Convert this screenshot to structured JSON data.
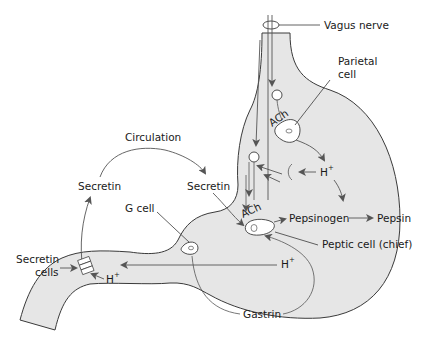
{
  "colors": {
    "stomach_fill": "#e6e6e6",
    "outline": "#3a3a3a",
    "arrow": "#555555",
    "text": "#1a1a1a"
  },
  "labels": {
    "vagus_nerve": "Vagus nerve",
    "parietal_cell_1": "Parietal",
    "parietal_cell_2": "cell",
    "circulation": "Circulation",
    "secretin_left": "Secretin",
    "secretin_right": "Secretin",
    "g_cell": "G cell",
    "ach_top": "ACh",
    "ach_bottom": "ACh",
    "h_plus_mid": "H",
    "h_plus_bottom": "H",
    "h_plus_duodenum": "H",
    "plus": "+",
    "pepsinogen": "Pepsinogen",
    "pepsin": "Pepsin",
    "peptic_cell": "Peptic cell (chief)",
    "secretin_cells_1": "Secretin",
    "secretin_cells_2": "cells",
    "gastrin": "Gastrin"
  }
}
